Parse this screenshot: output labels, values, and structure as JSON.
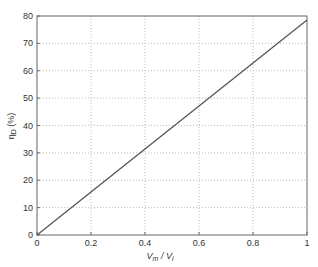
{
  "chart_data": {
    "type": "line",
    "title": "",
    "xlabel": "V_m / V_i",
    "ylabel": "η_D (%)",
    "xlim": [
      0,
      1
    ],
    "ylim": [
      0,
      80
    ],
    "grid": true,
    "x_ticks": [
      "0",
      "0.2",
      "0.4",
      "0.6",
      "0.8",
      "1"
    ],
    "y_ticks": [
      "0",
      "10",
      "20",
      "30",
      "40",
      "50",
      "60",
      "70",
      "80"
    ],
    "series": [
      {
        "name": "efficiency",
        "x": [
          0,
          0.2,
          0.4,
          0.6,
          0.8,
          1.0
        ],
        "y": [
          0,
          15.7,
          31.4,
          47.1,
          62.8,
          78.5
        ]
      }
    ],
    "line_color": "#555555"
  }
}
